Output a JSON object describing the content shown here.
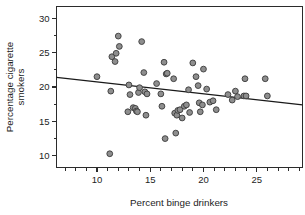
{
  "chart_data": {
    "type": "scatter",
    "title": "",
    "subtitle": "",
    "xlabel": "Percent binge drinkers",
    "ylabel": "Percentage cigarette smokers",
    "ylabel_line1": "Percentage cigarette",
    "ylabel_line2": "smokers",
    "xlim": [
      6.2,
      29.3
    ],
    "ylim": [
      8.3,
      31.7
    ],
    "xticks": [
      10,
      15,
      20,
      25
    ],
    "xtick_labels": [
      "10",
      "15",
      "20",
      "25"
    ],
    "xticks_minor_step": 1,
    "yticks": [
      10,
      15,
      20,
      25,
      30
    ],
    "ytick_labels": [
      "10",
      "15",
      "20",
      "25",
      "30"
    ],
    "yticks_minor_step": 2.5,
    "grid": false,
    "legend": null,
    "marker": {
      "shape": "circle",
      "fill_color": "#8e8e8e",
      "edge_color": "#3a3a3a",
      "radius_px": 2.9
    },
    "trendline": {
      "type": "linear-fit",
      "color": "#1a1a1a",
      "x_start": 6.2,
      "y_start": 21.4,
      "x_end": 29.3,
      "y_end": 17.4,
      "slope": -0.173,
      "intercept": 22.47
    },
    "n_points": 57,
    "x": [
      10.0,
      11.2,
      11.3,
      11.4,
      11.7,
      11.8,
      12.0,
      12.1,
      12.9,
      13.0,
      13.1,
      13.4,
      13.6,
      13.7,
      13.8,
      13.9,
      14.0,
      14.2,
      14.4,
      14.5,
      14.6,
      14.7,
      15.6,
      16.0,
      16.1,
      16.3,
      16.4,
      16.5,
      16.6,
      17.2,
      17.3,
      17.4,
      17.5,
      17.6,
      17.8,
      18.0,
      18.2,
      18.4,
      18.6,
      18.7,
      19.0,
      19.3,
      19.5,
      19.6,
      19.7,
      19.9,
      20.0,
      20.3,
      20.6,
      20.9,
      21.2,
      22.3,
      22.7,
      23.0,
      23.2,
      23.8,
      23.9,
      24.0,
      25.8,
      26.0
    ],
    "y": [
      21.5,
      10.3,
      19.4,
      24.4,
      23.7,
      24.9,
      27.4,
      25.9,
      16.4,
      20.3,
      18.9,
      17.0,
      16.9,
      16.5,
      16.4,
      19.2,
      19.9,
      26.6,
      22.1,
      19.3,
      15.9,
      19.0,
      20.5,
      19.0,
      17.2,
      23.6,
      12.5,
      21.9,
      22.0,
      21.2,
      16.2,
      13.3,
      15.9,
      16.6,
      16.7,
      15.5,
      17.2,
      17.4,
      19.6,
      16.3,
      23.5,
      21.5,
      20.2,
      17.7,
      16.4,
      17.4,
      22.6,
      19.7,
      17.8,
      18.0,
      16.7,
      18.9,
      18.1,
      19.4,
      18.6,
      18.7,
      21.2,
      18.7,
      21.2,
      18.7
    ]
  },
  "axis": {
    "x_title": "Percent binge drinkers",
    "y_title_line1": "Percentage cigarette",
    "y_title_line2": "smokers",
    "x_tick_0": "10",
    "x_tick_1": "15",
    "x_tick_2": "20",
    "x_tick_3": "25",
    "y_tick_0": "10",
    "y_tick_1": "15",
    "y_tick_2": "20",
    "y_tick_3": "25",
    "y_tick_4": "30"
  },
  "colors": {
    "background": "#ffffff",
    "axis": "#2b2b2b",
    "text": "#1d1d1d",
    "marker_fill": "#8e8e8e",
    "marker_edge": "#3a3a3a",
    "trendline": "#1a1a1a"
  }
}
